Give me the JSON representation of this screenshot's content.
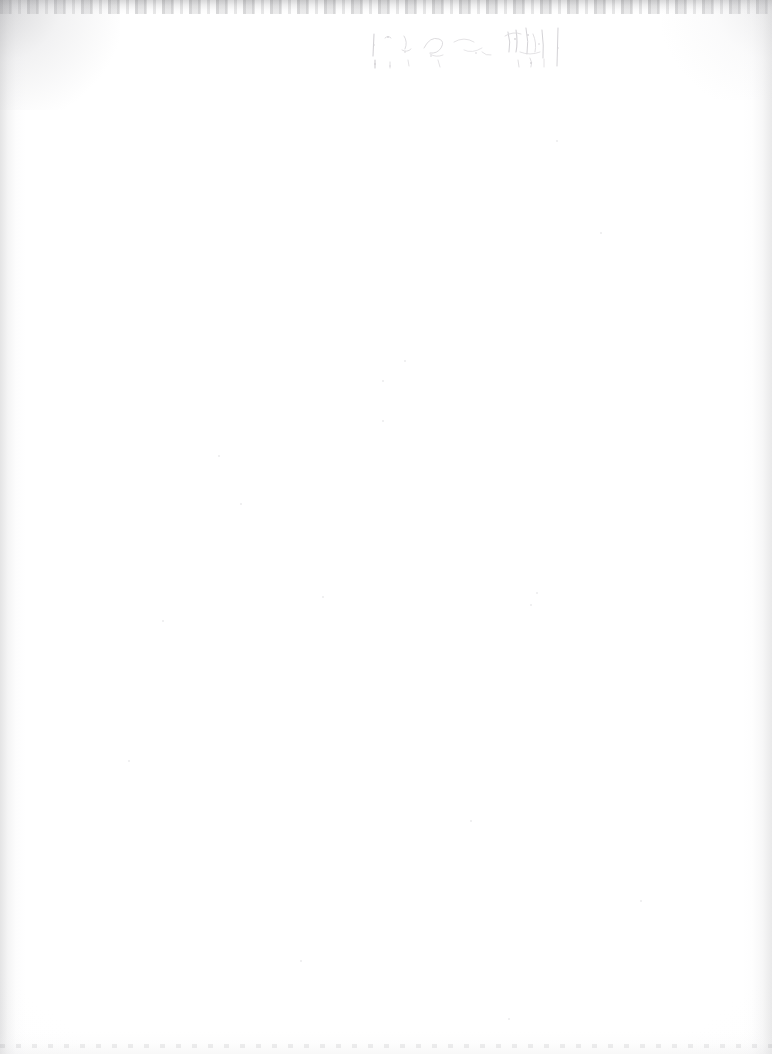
{
  "page": {
    "kind": "scanned-document-page",
    "orientation": "portrait",
    "width": 772,
    "height": 1054,
    "background_color": "#ffffff",
    "body_text": "",
    "body_note": "blank page — no printed body text"
  },
  "header_mark": {
    "name": "handwritten-header-mark",
    "legible": "no",
    "transcription": "",
    "description": "faint illegible handwritten mark",
    "ink_color": "#8e8a93",
    "position": {
      "left": 368,
      "top": 26,
      "width": 216,
      "height": 46
    }
  },
  "scan_artifacts": {
    "edge_shadow_color": "#a8a8aa",
    "top_edge_label": "top-edge-scan-shadow",
    "left_edge_label": "left-edge-scan-shadow",
    "right_edge_label": "right-edge-scan-shadow",
    "bottom_edge_label": "bottom-edge-scan-shadow",
    "corner_top_left_label": "top-left-corner-shadow",
    "corner_top_right_label": "top-right-corner-shadow",
    "speck_color": "#ebebed",
    "specks": [
      {
        "x": 218,
        "y": 455,
        "size": 2
      },
      {
        "x": 240,
        "y": 503,
        "size": 2
      },
      {
        "x": 404,
        "y": 360,
        "size": 2
      },
      {
        "x": 382,
        "y": 380,
        "size": 2
      },
      {
        "x": 382,
        "y": 420,
        "size": 2
      },
      {
        "x": 322,
        "y": 596,
        "size": 2
      },
      {
        "x": 536,
        "y": 592,
        "size": 2
      },
      {
        "x": 530,
        "y": 604,
        "size": 2
      },
      {
        "x": 162,
        "y": 620,
        "size": 2
      },
      {
        "x": 556,
        "y": 140,
        "size": 2
      },
      {
        "x": 600,
        "y": 232,
        "size": 2
      },
      {
        "x": 128,
        "y": 760,
        "size": 2
      },
      {
        "x": 470,
        "y": 820,
        "size": 2
      },
      {
        "x": 640,
        "y": 900,
        "size": 2
      },
      {
        "x": 300,
        "y": 960,
        "size": 2
      },
      {
        "x": 508,
        "y": 1018,
        "size": 2
      }
    ]
  }
}
